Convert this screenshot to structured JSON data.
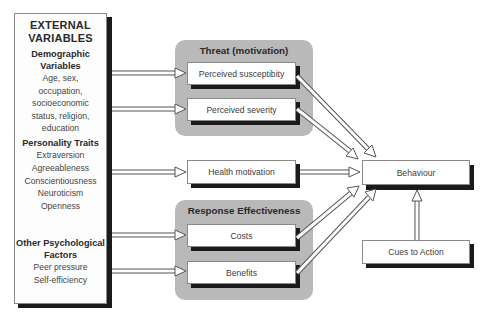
{
  "diagram": {
    "external": {
      "title_line1": "EXTERNAL",
      "title_line2": "VARIABLES",
      "demographic": {
        "heading_line1": "Demographic",
        "heading_line2": "Variables",
        "items": [
          "Age, sex,",
          "occupation,",
          "socioeconomic",
          "status, religion,",
          "education"
        ]
      },
      "personality": {
        "heading": "Personality Traits",
        "items": [
          "Extraversion",
          "Agreeableness",
          "Conscientiousness",
          "Neuroticism",
          "Openness"
        ]
      },
      "other": {
        "heading_line1": "Other Psychological",
        "heading_line2": "Factors",
        "items": [
          "Peer pressure",
          "Self-efficiency"
        ]
      }
    },
    "threat_group": {
      "title": "Threat (motivation)",
      "nodes": [
        "Perceived susceptibity",
        "Perceived severity"
      ]
    },
    "health_motivation": "Health motivation",
    "response_group": {
      "title": "Response Effectiveness",
      "nodes": [
        "Costs",
        "Benefits"
      ]
    },
    "behaviour": "Behaviour",
    "cues_to_action": "Cues to Action",
    "colors": {
      "group_fill": "#b9b9b9",
      "shadow": "#1a1a1a",
      "node_border": "#8a8a8a"
    }
  }
}
